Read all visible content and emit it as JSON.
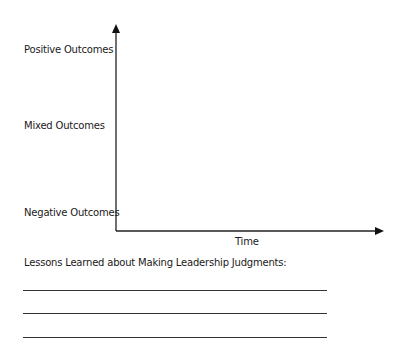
{
  "diagram": {
    "y_axis_labels": {
      "top": "Positive Outcomes",
      "middle": "Mixed Outcomes",
      "bottom": "Negative Outcomes"
    },
    "x_axis_label": "Time"
  },
  "lessons": {
    "heading": "Lessons Learned about Making Leadership Judgments:",
    "blank_lines": 3
  }
}
